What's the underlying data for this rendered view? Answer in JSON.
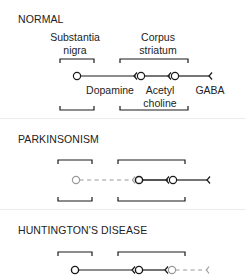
{
  "sections": [
    {
      "title": "NORMAL",
      "labels": {
        "substantia_nigra": "Substantia\nnigra",
        "corpus_striatum": "Corpus\nstriatum",
        "dopamine": "Dopamine",
        "acetylcholine": "Acetyl\ncholine",
        "gaba": "GABA"
      },
      "pathway": {
        "dopamine_neuron": "active",
        "acetylcholine_neuron": "active",
        "gaba_neuron": "active"
      }
    },
    {
      "title": "PARKINSONISM",
      "pathway": {
        "dopamine_neuron": "degenerated",
        "acetylcholine_neuron": "active",
        "gaba_neuron": "active"
      }
    },
    {
      "title": "HUNTINGTON'S DISEASE",
      "pathway": {
        "dopamine_neuron": "active",
        "acetylcholine_neuron": "active",
        "gaba_neuron": "degenerated"
      }
    }
  ],
  "colors": {
    "active": "#1a1a1a",
    "degenerated": "#9a9a9a",
    "separator": "#ececec"
  }
}
